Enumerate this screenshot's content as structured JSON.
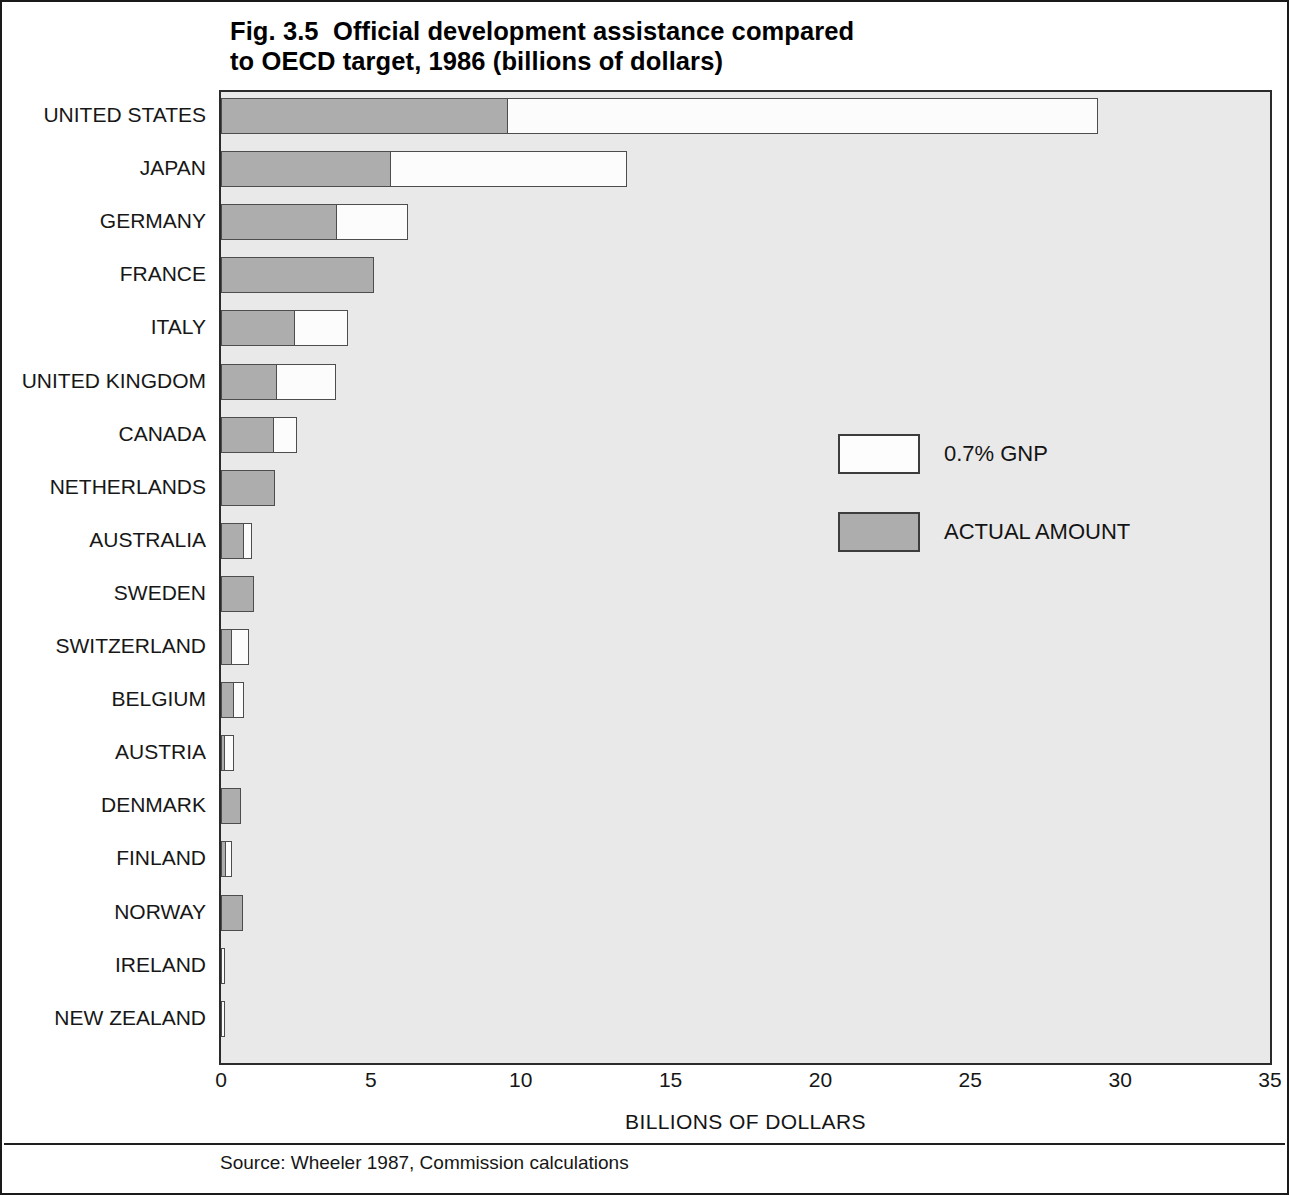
{
  "figure": {
    "title_line_1": "Fig. 3.5  Official development assistance compared",
    "title_line_2": "to OECD target, 1986 (billions of dollars)",
    "source": "Source: Wheeler 1987, Commission calculations"
  },
  "legend": {
    "position": "inside-right",
    "entries": [
      {
        "label": "0.7% GNP",
        "color": "#fdfdfd",
        "swatch": "target-swatch"
      },
      {
        "label": "ACTUAL AMOUNT",
        "color": "#adadad",
        "swatch": "actual-swatch"
      }
    ]
  },
  "axis": {
    "x_title": "BILLIONS OF DOLLARS",
    "x_ticks": [
      "0",
      "5",
      "10",
      "15",
      "20",
      "25",
      "30",
      "35"
    ]
  },
  "chart_data": {
    "type": "bar",
    "orientation": "horizontal",
    "stacked": true,
    "title": "Fig. 3.5  Official development assistance compared to OECD target, 1986 (billions of dollars)",
    "xlabel": "BILLIONS OF DOLLARS",
    "ylabel": "",
    "xlim": [
      0,
      35
    ],
    "xticks": [
      0,
      5,
      10,
      15,
      20,
      25,
      30,
      35
    ],
    "grid": false,
    "legend_position": "inside-right",
    "categories": [
      "UNITED STATES",
      "JAPAN",
      "GERMANY",
      "FRANCE",
      "ITALY",
      "UNITED KINGDOM",
      "CANADA",
      "NETHERLANDS",
      "AUSTRALIA",
      "SWEDEN",
      "SWITZERLAND",
      "BELGIUM",
      "AUSTRIA",
      "DENMARK",
      "FINLAND",
      "NORWAY",
      "IRELAND",
      "NEW ZEALAND"
    ],
    "series": [
      {
        "name": "ACTUAL AMOUNT",
        "color": "#adadad",
        "values": [
          9.6,
          5.7,
          3.9,
          5.1,
          2.5,
          1.9,
          1.8,
          1.8,
          0.8,
          1.1,
          0.4,
          0.47,
          0.15,
          0.67,
          0.18,
          0.73,
          0.0,
          0.0
        ]
      },
      {
        "name": "0.7% GNP",
        "color": "#fdfdfd",
        "values": [
          29.3,
          13.6,
          6.3,
          5.1,
          4.3,
          3.9,
          2.6,
          1.8,
          1.1,
          1.1,
          1.0,
          0.83,
          0.5,
          0.67,
          0.43,
          0.73,
          0.08,
          0.08
        ]
      }
    ]
  }
}
